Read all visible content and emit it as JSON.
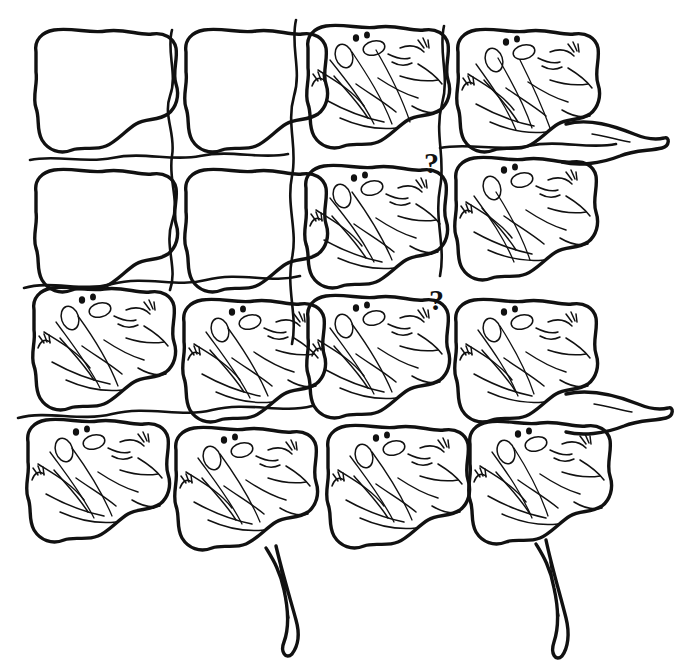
{
  "artwork": {
    "title": "Tessellation of interlocking lizard figures",
    "style": "hand-drawn black ink line art on white",
    "medium": "pen and ink line drawing",
    "background_color": "#ffffff",
    "ink_color": "#111111",
    "canvas": {
      "width": 688,
      "height": 664
    },
    "description": "An Escher-like plane-filling tessellation. Identical lizard/frog shaped tiles interlock without gaps. Tiles in the upper-left quadrant are left as bare outlines with no interior detail; detail (eyes, nostrils, limbs, body folds) progressively appears toward the lower-right. Limbs and tails of the edge tiles project past the block boundary at the right edge and along the bottom."
  },
  "grid": {
    "columns": 4,
    "rows": 4,
    "cell_width": 150,
    "cell_height": 140,
    "origin_x": 28,
    "origin_y": 22,
    "blank_cells": [
      "r0c0",
      "r0c1",
      "r1c0",
      "r1c1"
    ],
    "detailed_cells": [
      "r0c2",
      "r0c3",
      "r1c2",
      "r1c3",
      "r2c0",
      "r2c1",
      "r2c2",
      "r2c3",
      "r3c0",
      "r3c1",
      "r3c2",
      "r3c3"
    ]
  },
  "annotations": [
    {
      "id": "question-mark-upper",
      "label": "?",
      "x": 424,
      "y": 148,
      "font_size": 30
    },
    {
      "id": "question-mark-lower",
      "label": "?",
      "x": 429,
      "y": 285,
      "font_size": 30
    }
  ],
  "motif": {
    "name": "lizard",
    "features": [
      "large oval eye",
      "second oval eye",
      "two nostril dots",
      "snout",
      "forelimb with fingers",
      "hind limb",
      "tapering tail",
      "body contour folds"
    ],
    "repeat_count": 12,
    "blank_repeat_count": 4
  },
  "protrusions": {
    "right_edge": [
      "upper-right tail",
      "lower-right tail"
    ],
    "bottom_edge": [
      "left-of-center tail",
      "right-of-center tail"
    ]
  }
}
